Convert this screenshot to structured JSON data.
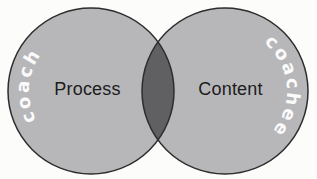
{
  "diagram": {
    "type": "venn",
    "left_circle": {
      "arc_label": "coach",
      "region_label": "Process"
    },
    "right_circle": {
      "arc_label": "coachee",
      "region_label": "Content"
    },
    "colors": {
      "circle_fill": "#b7b7ba",
      "overlap_fill": "#606062",
      "outline": "#2d2d2d",
      "arc_label_text": "#fbfbfb",
      "region_label_text": "#1c1c1c",
      "background": "#fcfcfb"
    }
  }
}
